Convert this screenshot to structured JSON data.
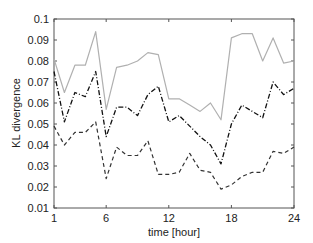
{
  "chart_data": {
    "type": "line",
    "title": "",
    "xlabel": "time [hour]",
    "ylabel": "KL divergence",
    "xlim": [
      1,
      24
    ],
    "ylim": [
      0.01,
      0.1
    ],
    "xticks": [
      1,
      6,
      12,
      18,
      24
    ],
    "xtick_labels": [
      "1",
      "6",
      "12",
      "18",
      "24"
    ],
    "yticks": [
      0.01,
      0.02,
      0.03,
      0.04,
      0.05,
      0.06,
      0.07,
      0.08,
      0.09,
      0.1
    ],
    "ytick_labels": [
      "0.01",
      "0.02",
      "0.03",
      "0.04",
      "0.05",
      "0.06",
      "0.07",
      "0.08",
      "0.09",
      "0.1"
    ],
    "grid": false,
    "legend": "none",
    "x": [
      1,
      2,
      3,
      4,
      5,
      6,
      7,
      8,
      9,
      10,
      11,
      12,
      13,
      14,
      15,
      16,
      17,
      18,
      19,
      20,
      21,
      22,
      23,
      24
    ],
    "series": [
      {
        "name": "solid-gray",
        "style": "solid",
        "color": "#b0b0b0",
        "values": [
          0.081,
          0.065,
          0.078,
          0.078,
          0.094,
          0.057,
          0.077,
          0.078,
          0.08,
          0.084,
          0.083,
          0.062,
          0.062,
          0.059,
          0.056,
          0.06,
          0.052,
          0.091,
          0.093,
          0.093,
          0.08,
          0.091,
          0.079,
          0.08
        ]
      },
      {
        "name": "dash-dot-black",
        "style": "dashdot",
        "color": "#111111",
        "values": [
          0.075,
          0.051,
          0.065,
          0.063,
          0.075,
          0.044,
          0.058,
          0.058,
          0.054,
          0.064,
          0.068,
          0.051,
          0.054,
          0.049,
          0.044,
          0.04,
          0.031,
          0.05,
          0.059,
          0.056,
          0.053,
          0.07,
          0.064,
          0.067
        ]
      },
      {
        "name": "dashed-dark",
        "style": "dashed",
        "color": "#333333",
        "values": [
          0.049,
          0.04,
          0.046,
          0.046,
          0.051,
          0.024,
          0.039,
          0.035,
          0.035,
          0.042,
          0.026,
          0.026,
          0.027,
          0.036,
          0.028,
          0.027,
          0.019,
          0.021,
          0.025,
          0.027,
          0.027,
          0.037,
          0.036,
          0.039
        ]
      }
    ]
  }
}
